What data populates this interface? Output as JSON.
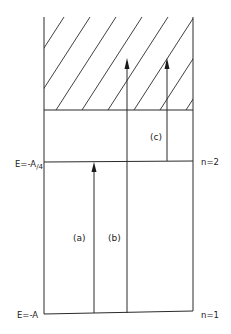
{
  "diagram": {
    "type": "energy-level-diagram",
    "levels": [
      {
        "id": "n1",
        "energy_label": "E=-A",
        "state_label": "n=1"
      },
      {
        "id": "n2",
        "energy_label": "E=-A/4",
        "energy_label_main": "E=-A",
        "energy_label_sub": "/4",
        "state_label": "n=2"
      }
    ],
    "continuum": {
      "label": "",
      "style": "diagonal-hatch"
    },
    "transitions": [
      {
        "id": "a",
        "label": "(a)",
        "from": "n=1",
        "to": "n=2"
      },
      {
        "id": "b",
        "label": "(b)",
        "from": "n=1",
        "to": "continuum"
      },
      {
        "id": "c",
        "label": "(c)",
        "from": "n=2",
        "to": "continuum"
      }
    ],
    "colors": {
      "line": "#2a2a2a",
      "background": "#ffffff"
    }
  }
}
